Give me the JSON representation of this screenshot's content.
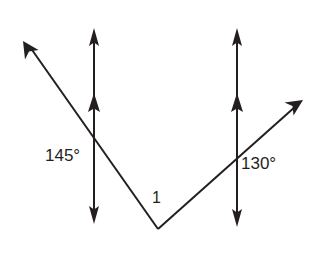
{
  "figure": {
    "background_color": "#ffffff",
    "stroke_color": "#231f20",
    "stroke_width": 2,
    "width": 324,
    "height": 253
  },
  "labels": {
    "left_angle": "145°",
    "right_angle": "130°",
    "vertex_angle": "1"
  },
  "geometry": {
    "parallel_lines": [
      {
        "name": "left-parallel-line",
        "x": 94,
        "y_top": 30,
        "y_bottom": 223,
        "top_arrowhead": true,
        "bottom_arrowhead": true,
        "direction_tick_y": 104
      },
      {
        "name": "right-parallel-line",
        "x": 237,
        "y_top": 30,
        "y_bottom": 226,
        "top_arrowhead": true,
        "bottom_arrowhead": true,
        "direction_tick_y": 104
      }
    ],
    "transversal": {
      "name": "v-shaped-transversal",
      "vertex": [
        158,
        229
      ],
      "left_ray_tip": [
        23,
        41
      ],
      "right_ray_tip": [
        303,
        100
      ],
      "left_arrowhead": true,
      "right_arrowhead": true
    },
    "intersections": [
      {
        "name": "left-intersection",
        "x": 94,
        "y": 140
      },
      {
        "name": "right-intersection",
        "x": 237,
        "y": 165
      }
    ]
  }
}
